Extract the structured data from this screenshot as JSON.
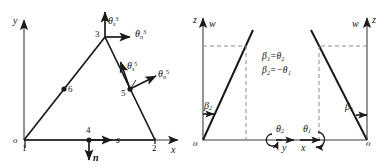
{
  "figure": {
    "type": "engineering-diagram",
    "stroke_color": "#1a1a1a",
    "dashed_color": "#8a8a8a",
    "background": "#ffffff"
  },
  "left_panel": {
    "name": "triangular-element",
    "axes": {
      "y_label": "y",
      "x_label": "x",
      "origin_label": "o"
    },
    "nodes": [
      {
        "id": "1",
        "label": "1",
        "x": 0,
        "y": 0,
        "role": "corner-origin"
      },
      {
        "id": "2",
        "label": "2",
        "x": 1,
        "y": 0,
        "role": "corner"
      },
      {
        "id": "3",
        "label": "3",
        "x": 0.68,
        "y": 1,
        "role": "apex"
      },
      {
        "id": "4",
        "label": "4",
        "x": 0.5,
        "y": 0,
        "role": "midside-bottom"
      },
      {
        "id": "5",
        "label": "5",
        "x": 0.84,
        "y": 0.5,
        "role": "midside-right"
      },
      {
        "id": "6",
        "label": "6",
        "x": 0.34,
        "y": 0.5,
        "role": "midside-left"
      }
    ],
    "local_axes": {
      "s_label": "s",
      "n_label": "n",
      "s_direction": "right",
      "n_direction": "down"
    },
    "dof_labels": [
      {
        "id": "theta-s-3",
        "symbol": "θ",
        "sub": "s",
        "sup": "3",
        "at_node": "3",
        "direction": "up"
      },
      {
        "id": "theta-n-3",
        "symbol": "θ",
        "sub": "n",
        "sup": "3",
        "at_node": "3",
        "direction": "right"
      },
      {
        "id": "theta-s-5",
        "symbol": "θ",
        "sub": "s",
        "sup": "5",
        "at_node": "5",
        "direction": "up-left-normal"
      },
      {
        "id": "theta-n-5",
        "symbol": "θ",
        "sub": "n",
        "sup": "5",
        "at_node": "5",
        "direction": "up-right"
      }
    ]
  },
  "right_panel": {
    "name": "beam-slope-convention",
    "left_diagram": {
      "vertical_axis_label": "z",
      "deflection_label": "w",
      "origin_label": "o",
      "slope_label": {
        "symbol": "β",
        "sub": "2"
      },
      "slope_sign": "positive-rising"
    },
    "right_diagram": {
      "vertical_axis_label": "z",
      "deflection_label": "w",
      "origin_label": "o",
      "slope_label": {
        "symbol": "β",
        "sub": "1"
      },
      "slope_sign": "negative-falling"
    },
    "equations": [
      {
        "lhs_sym": "β",
        "lhs_sub": "1",
        "rhs": "= θ",
        "rhs_sub": "2",
        "text": "β₁=θ₂"
      },
      {
        "lhs_sym": "β",
        "lhs_sub": "2",
        "rhs": "= −θ",
        "rhs_sub": "1",
        "text": "β₂=−θ₁"
      }
    ],
    "rotation_axes": [
      {
        "id": "theta-2-y",
        "theta_sym": "θ",
        "theta_sub": "2",
        "axis_label": "y",
        "axis_direction": "right",
        "rotation_sense": "counterclockwise"
      },
      {
        "id": "theta-1-x",
        "theta_sym": "θ",
        "theta_sub": "1",
        "axis_label": "x",
        "axis_direction": "left",
        "rotation_sense": "clockwise"
      }
    ]
  }
}
